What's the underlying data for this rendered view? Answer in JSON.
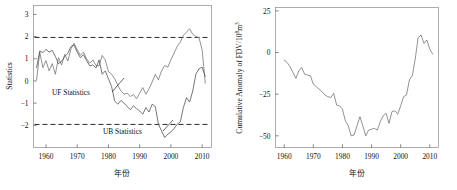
{
  "figure": {
    "panels": [
      {
        "id": "mann-kendall",
        "axis_title_y": "Statistics",
        "axis_title_x": "年份",
        "annotations": [
          {
            "name": "uf-statistics-label",
            "text": "UF Statistics"
          },
          {
            "name": "ub-statistics-label",
            "text": "UB Statistics"
          }
        ],
        "threshold_labels": [
          "1.96",
          "-1.96"
        ]
      },
      {
        "id": "cumulative-anomaly",
        "axis_title_y": "Cumulative Anomaly of FDV/10",
        "axis_title_y_sup1": "8",
        "axis_title_y_mid": "m",
        "axis_title_y_sup2": "3",
        "axis_title_x": "年份"
      }
    ]
  },
  "chart_data": [
    {
      "type": "line",
      "title": "",
      "xlabel": "年份",
      "ylabel": "Statistics",
      "xlim": [
        1956,
        2013
      ],
      "ylim": [
        -3.0,
        3.4
      ],
      "xticks": [
        1960,
        1970,
        1980,
        1990,
        2000,
        2010
      ],
      "yticks": [
        -2,
        -1,
        0,
        1,
        2,
        3
      ],
      "grid": false,
      "legend": "inline-annotations",
      "annotations": [
        {
          "text": "UF Statistics",
          "x": 1971.5,
          "y": 0.1
        },
        {
          "text": "UB Statistics",
          "x": 1992.0,
          "y": -1.72
        }
      ],
      "reference_lines": [
        {
          "value": 1.96,
          "style": "dashed",
          "label": "1.96"
        },
        {
          "value": -1.96,
          "style": "dashed",
          "label": "-1.96"
        }
      ],
      "x": [
        1957,
        1958,
        1959,
        1960,
        1961,
        1962,
        1963,
        1964,
        1965,
        1966,
        1967,
        1968,
        1969,
        1970,
        1971,
        1972,
        1973,
        1974,
        1975,
        1976,
        1977,
        1978,
        1979,
        1980,
        1981,
        1982,
        1983,
        1984,
        1985,
        1986,
        1987,
        1988,
        1989,
        1990,
        1991,
        1992,
        1993,
        1994,
        1995,
        1996,
        1997,
        1998,
        1999,
        2000,
        2001,
        2002,
        2003,
        2004,
        2005,
        2006,
        2007,
        2008,
        2009,
        2010,
        2011
      ],
      "series": [
        {
          "name": "UF Statistics",
          "values": [
            0.05,
            1.3,
            0.6,
            0.92,
            0.45,
            0.78,
            0.3,
            1.05,
            0.72,
            1.2,
            0.9,
            1.45,
            1.7,
            1.4,
            1.15,
            1.3,
            1.0,
            0.8,
            0.95,
            0.7,
            0.68,
            1.15,
            0.95,
            0.42,
            0.3,
            0.1,
            -0.2,
            -0.45,
            -0.6,
            -0.55,
            -0.7,
            -0.62,
            -0.8,
            -0.55,
            -0.3,
            -0.6,
            -0.35,
            -0.05,
            0.3,
            0.05,
            0.45,
            0.7,
            0.62,
            0.95,
            1.25,
            1.55,
            1.75,
            2.05,
            2.2,
            2.35,
            2.1,
            2.0,
            1.95,
            1.4,
            -0.1
          ]
        },
        {
          "name": "UB Statistics",
          "values": [
            0.6,
            1.35,
            1.28,
            1.42,
            1.3,
            1.38,
            1.1,
            0.78,
            0.88,
            1.1,
            1.25,
            1.55,
            1.62,
            1.3,
            1.05,
            1.18,
            0.92,
            0.68,
            0.72,
            0.58,
            0.95,
            0.3,
            0.45,
            0.1,
            -0.25,
            -0.9,
            -1.05,
            -0.88,
            -1.0,
            -1.15,
            -1.3,
            -1.12,
            -1.25,
            -1.35,
            -1.5,
            -1.2,
            -1.4,
            -1.05,
            -1.15,
            -1.95,
            -2.25,
            -2.55,
            -2.4,
            -2.3,
            -2.15,
            -1.95,
            -1.85,
            -1.2,
            -0.75,
            -0.95,
            -0.45,
            0.3,
            0.55,
            0.62,
            0.2
          ]
        }
      ]
    },
    {
      "type": "line",
      "title": "",
      "xlabel": "年份",
      "ylabel": "Cumulative Anomaly of FDV/10⁸m³",
      "xlim": [
        1957,
        2013
      ],
      "ylim": [
        -57,
        27
      ],
      "xticks": [
        1960,
        1970,
        1980,
        1990,
        2000,
        2010
      ],
      "yticks": [
        -50,
        -25,
        0,
        25
      ],
      "grid": false,
      "x": [
        1960,
        1961,
        1962,
        1963,
        1964,
        1965,
        1966,
        1967,
        1968,
        1969,
        1970,
        1971,
        1972,
        1973,
        1974,
        1975,
        1976,
        1977,
        1978,
        1979,
        1980,
        1981,
        1982,
        1983,
        1984,
        1985,
        1986,
        1987,
        1988,
        1989,
        1990,
        1991,
        1992,
        1993,
        1994,
        1995,
        1996,
        1997,
        1998,
        1999,
        2000,
        2001,
        2002,
        2003,
        2004,
        2005,
        2006,
        2007,
        2008,
        2009,
        2010,
        2011
      ],
      "series": [
        {
          "name": "Cumulative Anomaly of FDV",
          "values": [
            -4.5,
            -6.0,
            -8.5,
            -12.0,
            -15.5,
            -11.0,
            -9.0,
            -13.0,
            -13.5,
            -14.0,
            -19.0,
            -20.5,
            -22.0,
            -23.5,
            -25.5,
            -26.5,
            -27.0,
            -24.5,
            -31.5,
            -32.0,
            -34.0,
            -41.0,
            -44.0,
            -50.0,
            -49.5,
            -44.0,
            -38.5,
            -44.0,
            -50.0,
            -46.5,
            -46.0,
            -45.5,
            -46.5,
            -41.5,
            -38.0,
            -36.5,
            -42.5,
            -35.5,
            -35.0,
            -37.0,
            -32.0,
            -26.5,
            -25.5,
            -16.5,
            -14.0,
            -4.0,
            9.0,
            10.5,
            5.5,
            7.5,
            2.0,
            -1.0
          ]
        }
      ]
    }
  ]
}
